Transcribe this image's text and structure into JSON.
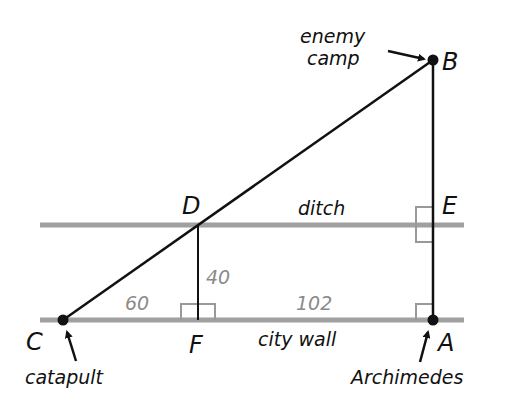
{
  "diagram": {
    "points": {
      "A": {
        "label": "A",
        "annotation": "Archimedes"
      },
      "B": {
        "label": "B",
        "annotation_line1": "enemy",
        "annotation_line2": "camp"
      },
      "C": {
        "label": "C",
        "annotation": "catapult"
      },
      "D": {
        "label": "D"
      },
      "E": {
        "label": "E"
      },
      "F": {
        "label": "F"
      }
    },
    "lines": {
      "ditch": "ditch",
      "wall": "city wall"
    },
    "measurements": {
      "CF": "60",
      "DF": "40",
      "FA": "102"
    },
    "colors": {
      "line_gray": "#a0a0a0",
      "ink": "#111111",
      "number_gray": "#8a8a8a"
    }
  }
}
